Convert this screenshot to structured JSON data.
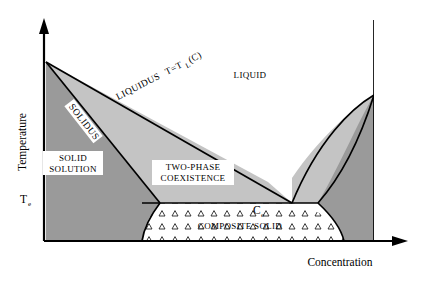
{
  "figure": {
    "type": "eutectic-phase-diagram",
    "title": "",
    "background_color": "#ffffff",
    "line_color": "#000000"
  },
  "axes": {
    "y_label": "Temperature",
    "x_label": "Concentration",
    "y_tick_label": "Te",
    "y_tick_base": "T",
    "y_tick_sub": "e",
    "x_origin_label": "",
    "arrowheads": "both-axes"
  },
  "regions": [
    {
      "key": "liquid",
      "label": "LIQUID",
      "fill": "#ffffff",
      "description": "single-phase liquid above both liquidus branches"
    },
    {
      "key": "solid_solution",
      "label": "SOLID SOLUTION",
      "label_line1": "SOLID",
      "label_line2": "SOLUTION",
      "fill": "#9a9a9a",
      "description": "alpha solid solution on the left of the diagram"
    },
    {
      "key": "two_phase",
      "label": "TWO-PHASE COEXISTENCE",
      "label_line1": "TWO-PHASE",
      "label_line2": "COEXISTENCE",
      "fill": "#c4c4c4",
      "description": "liquid plus solid coexistence wedge between liquidus and solidus"
    },
    {
      "key": "composite_solid",
      "label": "COMPOSITE SOLID",
      "fill": "#ffffff",
      "pattern": "triangle-stipple",
      "description": "two-phase lamellar eutectic solid below the eutectic temperature"
    },
    {
      "key": "right_solid_solution",
      "label": "",
      "fill": "#9a9a9a",
      "description": "beta solid solution hugging the right-hand axis"
    },
    {
      "key": "right_two_phase",
      "label": "",
      "fill": "#c4c4c4",
      "description": "right-side liquid plus solid coexistence wedge"
    }
  ],
  "curves": [
    {
      "key": "liquidus",
      "label": "LIQUIDUS  T=TL(C)",
      "label_main": "LIQUIDUS",
      "label_eq_t": "T=T",
      "label_eq_sub": "L",
      "label_eq_arg": "(C)",
      "rotation_deg": -27
    },
    {
      "key": "solidus",
      "label": "SOLIDUS",
      "rotation_deg": -56
    }
  ],
  "points": [
    {
      "key": "eutectic_concentration",
      "label_base": "C",
      "label_sub": "e",
      "label": "Ce",
      "description": "eutectic composition marked on the eutectic isotherm"
    }
  ]
}
